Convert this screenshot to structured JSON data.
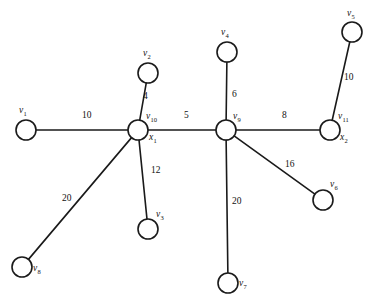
{
  "figure": {
    "title": "",
    "background_color": "#ffffff",
    "stroke_color": "#1a1a1a",
    "text_color": "#111111",
    "width": 377,
    "height": 308
  },
  "chart_data": {
    "type": "diagram",
    "graph_type": "weighted-undirected-graph",
    "title": "",
    "xlabel": "",
    "ylabel": "",
    "grid": false,
    "legend": null,
    "nodes": [
      {
        "id": "v1",
        "base": "v",
        "sub": "1",
        "x": 26,
        "y": 130,
        "r": 10,
        "label_x": 19,
        "label_y": 106,
        "aliases": []
      },
      {
        "id": "v2",
        "base": "v",
        "sub": "2",
        "x": 148,
        "y": 73,
        "r": 10,
        "label_x": 143,
        "label_y": 49,
        "aliases": []
      },
      {
        "id": "v3",
        "base": "v",
        "sub": "3",
        "x": 148,
        "y": 229,
        "r": 10,
        "label_x": 156,
        "label_y": 210,
        "aliases": []
      },
      {
        "id": "v4",
        "base": "v",
        "sub": "4",
        "x": 227,
        "y": 52,
        "r": 10,
        "label_x": 221,
        "label_y": 28,
        "aliases": []
      },
      {
        "id": "v5",
        "base": "v",
        "sub": "5",
        "x": 352,
        "y": 32,
        "r": 10,
        "label_x": 347,
        "label_y": 9,
        "aliases": []
      },
      {
        "id": "v6",
        "base": "v",
        "sub": "6",
        "x": 323,
        "y": 200,
        "r": 10,
        "label_x": 330,
        "label_y": 180,
        "aliases": []
      },
      {
        "id": "v7",
        "base": "v",
        "sub": "7",
        "x": 228,
        "y": 283,
        "r": 10,
        "label_x": 239,
        "label_y": 279,
        "aliases": []
      },
      {
        "id": "v8",
        "base": "v",
        "sub": "8",
        "x": 22,
        "y": 267,
        "r": 10,
        "label_x": 33,
        "label_y": 264,
        "aliases": []
      },
      {
        "id": "v9",
        "base": "v",
        "sub": "9",
        "x": 226,
        "y": 130,
        "r": 10,
        "label_x": 233,
        "label_y": 112,
        "aliases": []
      },
      {
        "id": "v10",
        "base": "v",
        "sub": "10",
        "x": 138,
        "y": 130,
        "r": 10,
        "label_x": 146,
        "label_y": 112,
        "alias_base": "x",
        "alias_sub": "1",
        "alias_x": 149,
        "alias_y": 133
      },
      {
        "id": "v11",
        "base": "v",
        "sub": "11",
        "x": 330,
        "y": 130,
        "r": 10,
        "label_x": 338,
        "label_y": 112,
        "alias_base": "x",
        "alias_sub": "2",
        "alias_x": 340,
        "alias_y": 133
      }
    ],
    "edges": [
      {
        "from": "v1",
        "to": "v10",
        "weight": 10,
        "label_x": 82,
        "label_y": 111
      },
      {
        "from": "v2",
        "to": "v10",
        "weight": 4,
        "label_x": 143,
        "label_y": 92
      },
      {
        "from": "v10",
        "to": "v3",
        "weight": 12,
        "label_x": 151,
        "label_y": 166
      },
      {
        "from": "v10",
        "to": "v8",
        "weight": 20,
        "label_x": 62,
        "label_y": 194
      },
      {
        "from": "v10",
        "to": "v9",
        "weight": 5,
        "label_x": 184,
        "label_y": 111
      },
      {
        "from": "v4",
        "to": "v9",
        "weight": 6,
        "label_x": 232,
        "label_y": 90
      },
      {
        "from": "v9",
        "to": "v7",
        "weight": 20,
        "label_x": 232,
        "label_y": 197
      },
      {
        "from": "v9",
        "to": "v6",
        "weight": 16,
        "label_x": 285,
        "label_y": 160
      },
      {
        "from": "v9",
        "to": "v11",
        "weight": 8,
        "label_x": 282,
        "label_y": 111
      },
      {
        "from": "v11",
        "to": "v5",
        "weight": 10,
        "label_x": 344,
        "label_y": 73
      }
    ]
  }
}
